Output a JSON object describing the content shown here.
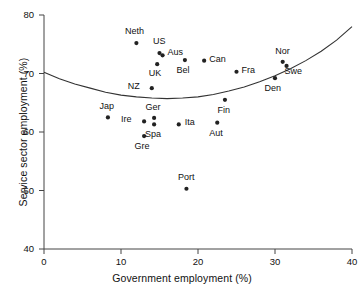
{
  "chart_data": {
    "type": "scatter",
    "title": "",
    "xlabel": "Government employment (%)",
    "ylabel": "Service sector employment (%)",
    "xlim": [
      0,
      40
    ],
    "ylim": [
      40,
      80
    ],
    "xticks": [
      0,
      10,
      20,
      30,
      40
    ],
    "yticks": [
      40,
      50,
      60,
      70,
      80
    ],
    "xtick_labels": [
      "0",
      "10",
      "20",
      "30",
      "40"
    ],
    "ytick_labels": [
      "40",
      "50",
      "60",
      "70",
      "80"
    ],
    "grid": false,
    "legend": "none",
    "marker_color": "#222222",
    "curve_color": "#333333",
    "axis_color": "#444444",
    "points": [
      {
        "label": "Neth",
        "x": 12.0,
        "y": 75.2,
        "label_dx": -2,
        "label_dy": -11
      },
      {
        "label": "US",
        "x": 15.0,
        "y": 73.5,
        "label_dx": 0,
        "label_dy": -11
      },
      {
        "label": "Aus",
        "x": 15.4,
        "y": 73.1,
        "label_dx": 5,
        "label_dy": -2
      },
      {
        "label": "UK",
        "x": 14.7,
        "y": 71.6,
        "label_dx": -2,
        "label_dy": 10
      },
      {
        "label": "Bel",
        "x": 18.3,
        "y": 72.3,
        "label_dx": -2,
        "label_dy": 11
      },
      {
        "label": "Can",
        "x": 20.8,
        "y": 72.2,
        "label_dx": 5,
        "label_dy": -1
      },
      {
        "label": "Fra",
        "x": 25.0,
        "y": 70.3,
        "label_dx": 5,
        "label_dy": -1
      },
      {
        "label": "Nor",
        "x": 31.0,
        "y": 72.0,
        "label_dx": 0,
        "label_dy": -10
      },
      {
        "label": "Swe",
        "x": 31.5,
        "y": 71.3,
        "label_dx": 7,
        "label_dy": 6
      },
      {
        "label": "Den",
        "x": 30.0,
        "y": 69.2,
        "label_dx": -2,
        "label_dy": 11
      },
      {
        "label": "NZ",
        "x": 14.0,
        "y": 67.5,
        "label_dx": -12,
        "label_dy": -1
      },
      {
        "label": "Fin",
        "x": 23.5,
        "y": 65.5,
        "label_dx": -1,
        "label_dy": 11
      },
      {
        "label": "Jap",
        "x": 8.3,
        "y": 62.5,
        "label_dx": -1,
        "label_dy": -10
      },
      {
        "label": "Ger",
        "x": 14.3,
        "y": 62.4,
        "label_dx": -1,
        "label_dy": -10
      },
      {
        "label": "Ire",
        "x": 13.0,
        "y": 61.8,
        "label_dx": -12,
        "label_dy": -1
      },
      {
        "label": "Spa",
        "x": 14.3,
        "y": 61.3,
        "label_dx": -1,
        "label_dy": 11
      },
      {
        "label": "Ita",
        "x": 17.5,
        "y": 61.3,
        "label_dx": 6,
        "label_dy": -1
      },
      {
        "label": "Aut",
        "x": 22.5,
        "y": 61.6,
        "label_dx": -1,
        "label_dy": 11
      },
      {
        "label": "Gre",
        "x": 13.0,
        "y": 59.3,
        "label_dx": -2,
        "label_dy": 11
      },
      {
        "label": "Port",
        "x": 18.5,
        "y": 50.3,
        "label_dx": 0,
        "label_dy": -11
      }
    ],
    "fitted_curve": {
      "description": "quadratic fit",
      "x": [
        0,
        2,
        4,
        6,
        8,
        10,
        12,
        14,
        16,
        18,
        20,
        22,
        24,
        26,
        28,
        30,
        32,
        34,
        36,
        38,
        40
      ],
      "y": [
        70.2,
        69.1,
        68.2,
        67.5,
        66.8,
        66.3,
        66.0,
        65.8,
        65.7,
        65.8,
        66.0,
        66.4,
        67.0,
        67.7,
        68.6,
        69.6,
        70.8,
        72.2,
        73.8,
        75.7,
        78.0
      ]
    }
  }
}
